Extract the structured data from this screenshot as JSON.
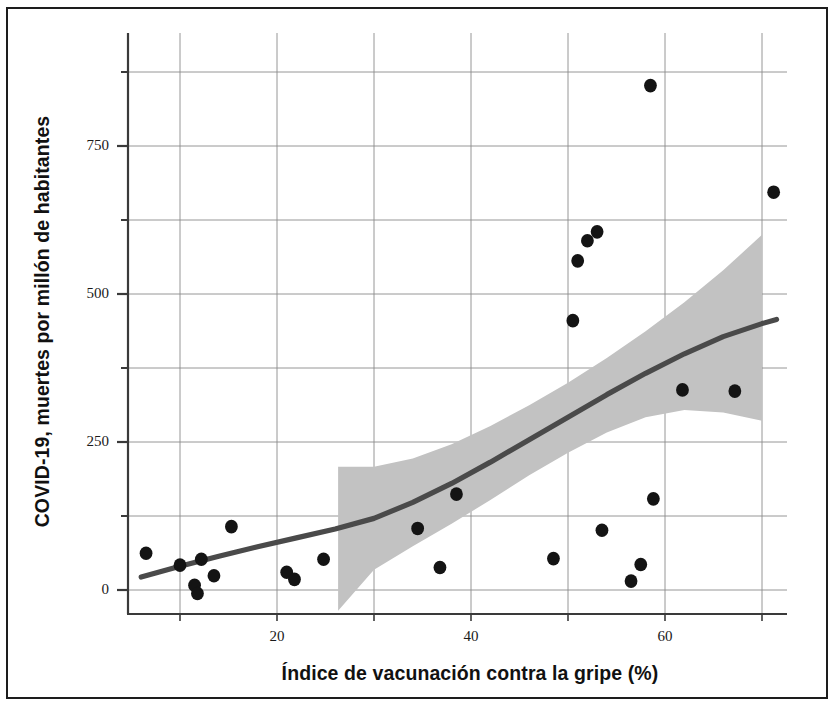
{
  "figure": {
    "background_color": "#ffffff",
    "frame_color": "#1d1d1d",
    "point_color": "#141414",
    "line_color": "#4a4a4a",
    "band_color": "#c2c2c2",
    "grid_color": "#8a8a8a",
    "axis_color": "#3a3a3a"
  },
  "chart_data": {
    "type": "scatter",
    "title": "",
    "subtitle": "",
    "xlabel": "Índice de vacunación contra la gripe (%)",
    "ylabel": "COVID-19, muertes por millón de habitantes",
    "xlim": [
      4.5,
      73.5
    ],
    "ylim": [
      -55,
      930
    ],
    "grid": true,
    "legend": null,
    "x_ticks": [
      20,
      40,
      60
    ],
    "x_tick_labels": [
      "20",
      "40",
      "60"
    ],
    "x_gridlines": [
      10,
      20,
      30,
      40,
      50,
      60,
      70
    ],
    "y_ticks": [
      0,
      250,
      500,
      750
    ],
    "y_tick_labels": [
      "0",
      "250",
      "500",
      "750"
    ],
    "y_minor_ticks": [
      125,
      375,
      625,
      875
    ],
    "y_gridlines": [
      0,
      125,
      250,
      375,
      500,
      625,
      750,
      875
    ],
    "points": [
      {
        "x": 6.5,
        "y": 62
      },
      {
        "x": 10.0,
        "y": 42
      },
      {
        "x": 11.5,
        "y": 8
      },
      {
        "x": 11.8,
        "y": -6
      },
      {
        "x": 12.2,
        "y": 52
      },
      {
        "x": 13.5,
        "y": 24
      },
      {
        "x": 15.3,
        "y": 107
      },
      {
        "x": 21.0,
        "y": 30
      },
      {
        "x": 21.8,
        "y": 18
      },
      {
        "x": 24.8,
        "y": 52
      },
      {
        "x": 34.5,
        "y": 104
      },
      {
        "x": 36.8,
        "y": 38
      },
      {
        "x": 38.5,
        "y": 162
      },
      {
        "x": 48.5,
        "y": 53
      },
      {
        "x": 50.5,
        "y": 455
      },
      {
        "x": 51.0,
        "y": 556
      },
      {
        "x": 52.0,
        "y": 590
      },
      {
        "x": 53.0,
        "y": 605
      },
      {
        "x": 53.5,
        "y": 101
      },
      {
        "x": 56.5,
        "y": 15
      },
      {
        "x": 57.5,
        "y": 43
      },
      {
        "x": 58.5,
        "y": 852
      },
      {
        "x": 58.8,
        "y": 154
      },
      {
        "x": 61.8,
        "y": 338
      },
      {
        "x": 67.2,
        "y": 336
      },
      {
        "x": 71.2,
        "y": 672
      }
    ],
    "trend_line": {
      "label": "línea de tendencia ajustada",
      "points": [
        {
          "x": 6.0,
          "y": 22
        },
        {
          "x": 10.0,
          "y": 40
        },
        {
          "x": 14.0,
          "y": 57
        },
        {
          "x": 18.0,
          "y": 73
        },
        {
          "x": 22.0,
          "y": 88
        },
        {
          "x": 26.0,
          "y": 103
        },
        {
          "x": 30.0,
          "y": 121
        },
        {
          "x": 34.0,
          "y": 148
        },
        {
          "x": 38.0,
          "y": 180
        },
        {
          "x": 42.0,
          "y": 216
        },
        {
          "x": 46.0,
          "y": 254
        },
        {
          "x": 50.0,
          "y": 292
        },
        {
          "x": 54.0,
          "y": 330
        },
        {
          "x": 58.0,
          "y": 366
        },
        {
          "x": 62.0,
          "y": 399
        },
        {
          "x": 66.0,
          "y": 428
        },
        {
          "x": 70.0,
          "y": 450
        },
        {
          "x": 71.5,
          "y": 457
        }
      ]
    },
    "confidence_band": {
      "label": "intervalo de confianza",
      "x_start": 26.3,
      "x_end": 70.0,
      "upper": [
        {
          "x": 26.3,
          "y": 208
        },
        {
          "x": 30.0,
          "y": 208
        },
        {
          "x": 34.0,
          "y": 222
        },
        {
          "x": 38.0,
          "y": 246
        },
        {
          "x": 42.0,
          "y": 277
        },
        {
          "x": 46.0,
          "y": 312
        },
        {
          "x": 50.0,
          "y": 350
        },
        {
          "x": 54.0,
          "y": 392
        },
        {
          "x": 58.0,
          "y": 437
        },
        {
          "x": 62.0,
          "y": 486
        },
        {
          "x": 66.0,
          "y": 540
        },
        {
          "x": 70.0,
          "y": 600
        }
      ],
      "lower": [
        {
          "x": 26.3,
          "y": -35
        },
        {
          "x": 30.0,
          "y": 34
        },
        {
          "x": 34.0,
          "y": 74
        },
        {
          "x": 38.0,
          "y": 112
        },
        {
          "x": 42.0,
          "y": 152
        },
        {
          "x": 46.0,
          "y": 194
        },
        {
          "x": 50.0,
          "y": 232
        },
        {
          "x": 54.0,
          "y": 266
        },
        {
          "x": 58.0,
          "y": 292
        },
        {
          "x": 62.0,
          "y": 304
        },
        {
          "x": 66.0,
          "y": 300
        },
        {
          "x": 70.0,
          "y": 286
        }
      ]
    }
  }
}
